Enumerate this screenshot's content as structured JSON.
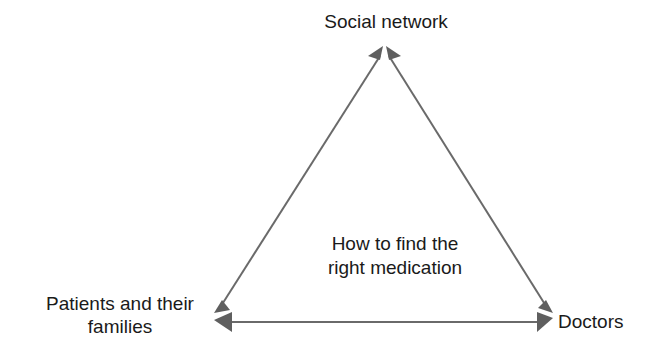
{
  "diagram": {
    "type": "triangle-relationship",
    "center_label": {
      "line1": "How to find the",
      "line2": "right medication"
    },
    "nodes": [
      {
        "id": "social",
        "label": "Social network",
        "position": "top"
      },
      {
        "id": "patients",
        "label_line1": "Patients and their",
        "label_line2": "families",
        "position": "bottom-left"
      },
      {
        "id": "doctors",
        "label": "Doctors",
        "position": "bottom-right"
      }
    ],
    "edges": [
      {
        "from": "patients",
        "to": "social",
        "style": "bidirectional-arrow"
      },
      {
        "from": "social",
        "to": "doctors",
        "style": "bidirectional-arrow"
      },
      {
        "from": "patients",
        "to": "doctors",
        "style": "bidirectional-arrow"
      }
    ],
    "colors": {
      "text": "#1a1a1a",
      "arrow": "#6a6a6a",
      "background": "#ffffff"
    }
  }
}
